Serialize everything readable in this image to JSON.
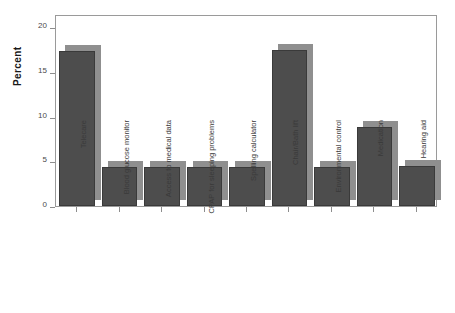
{
  "chart": {
    "ylabel": "Percent",
    "xlabel": "",
    "title": ""
  },
  "chart_data": {
    "type": "bar",
    "title": "",
    "xlabel": "",
    "ylabel": "Percent",
    "categories": [
      "Telecare",
      "Blood glucose monitor",
      "Access to medical data",
      "CPAP for sleeping problems",
      "Spelling calculator",
      "Chair/Bath lift",
      "Environmental control",
      "Medication",
      "Hearing aid"
    ],
    "values": [
      17.4,
      4.4,
      4.4,
      4.4,
      4.4,
      17.5,
      4.4,
      8.9,
      4.5
    ],
    "ylim": [
      0,
      21.5
    ],
    "yticks": [
      0,
      5,
      10,
      15,
      20
    ],
    "ytick_labels": [
      "0",
      "5",
      "10",
      "15",
      "20"
    ],
    "grid": false,
    "legend": null,
    "bar_color": "#4d4d4d",
    "bar_shadow_color": "#8f8f8f",
    "frame_color": "#9a9a9a",
    "background": "#ffffff"
  }
}
